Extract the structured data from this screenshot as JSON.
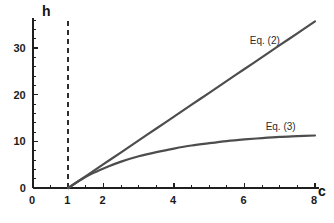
{
  "chart_data": {
    "type": "line",
    "title": "",
    "xlabel": "c",
    "ylabel": "h",
    "xlim": [
      0,
      8
    ],
    "ylim": [
      0,
      36
    ],
    "grid": false,
    "legend_position": "inline-annotation",
    "x_ticks_major": [
      0,
      1,
      2,
      4,
      6,
      8
    ],
    "x_tick_labels": [
      "0",
      "1",
      "2",
      "4",
      "6",
      "8"
    ],
    "x_ticks_minor_step": 0.5,
    "y_ticks_major": [
      0,
      10,
      20,
      30
    ],
    "y_tick_labels": [
      "0",
      "10",
      "20",
      "30"
    ],
    "y_ticks_minor_step": 2,
    "annotations": [
      {
        "text": "Eq. (2)",
        "x": 6.15,
        "y": 32.5
      },
      {
        "text": "Eq. (3)",
        "x": 6.6,
        "y": 14.2
      }
    ],
    "series": [
      {
        "name": "Eq. (2)",
        "label": "Eq. (2)",
        "color": "#4d4d4d",
        "width": 2.2,
        "style": "solid",
        "x": [
          1.0,
          1.5,
          2.0,
          2.5,
          3.0,
          3.5,
          4.0,
          4.5,
          5.0,
          5.5,
          6.0,
          6.5,
          7.0,
          7.5,
          8.0
        ],
        "y": [
          0.0,
          2.55,
          5.1,
          7.65,
          10.2,
          12.75,
          15.3,
          17.85,
          20.4,
          22.95,
          25.5,
          28.05,
          30.6,
          33.15,
          35.7
        ]
      },
      {
        "name": "Eq. (3)",
        "label": "Eq. (3)",
        "color": "#4d4d4d",
        "width": 2.2,
        "style": "solid",
        "x": [
          1.0,
          1.25,
          1.5,
          1.75,
          2.0,
          2.5,
          3.0,
          3.5,
          4.0,
          4.5,
          5.0,
          5.5,
          6.0,
          6.5,
          7.0,
          7.5,
          8.0
        ],
        "y": [
          0.0,
          1.25,
          2.4,
          3.35,
          4.2,
          5.65,
          6.8,
          7.7,
          8.45,
          9.1,
          9.6,
          10.05,
          10.4,
          10.7,
          10.95,
          11.1,
          11.25
        ]
      }
    ],
    "reference_lines": [
      {
        "name": "asymptote at c = 1",
        "orientation": "vertical",
        "value": 1,
        "style": "dashed",
        "color": "#2e2e2e",
        "y_from": 0,
        "y_to": 36
      }
    ]
  },
  "axis": {
    "y_name": "h",
    "x_name": "c"
  }
}
